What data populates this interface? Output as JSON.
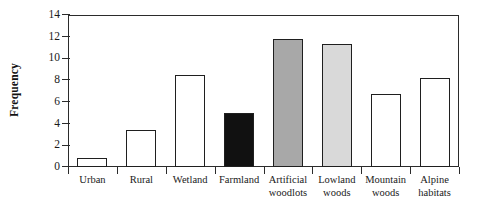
{
  "chart_data": {
    "type": "bar",
    "title": "",
    "xlabel": "",
    "ylabel": "Frequency",
    "ylim": [
      0,
      14
    ],
    "ytick_values": [
      0,
      2,
      4,
      6,
      8,
      10,
      12,
      14
    ],
    "ytick_labels": [
      "0",
      "2",
      "4",
      "6",
      "8",
      "10",
      "12",
      "14"
    ],
    "grid": false,
    "legend": "none",
    "categories": [
      "Urban",
      "Rural",
      "Wetland",
      "Farmland",
      "Artificial woodlots",
      "Lowland woods",
      "Mountain woods",
      "Alpine habitats"
    ],
    "category_lines": [
      [
        "Urban"
      ],
      [
        "Rural"
      ],
      [
        "Wetland"
      ],
      [
        "Farmland"
      ],
      [
        "Artificial",
        "woodlots"
      ],
      [
        "Lowland",
        "woods"
      ],
      [
        "Mountain",
        "woods"
      ],
      [
        "Alpine",
        "habitats"
      ]
    ],
    "values": [
      0.8,
      3.4,
      8.5,
      5.0,
      11.8,
      11.3,
      6.7,
      8.2
    ],
    "bar_fills": [
      "#ffffff",
      "#ffffff",
      "#ffffff",
      "#111111",
      "#a8a8a8",
      "#d9d9d9",
      "#ffffff",
      "#ffffff"
    ],
    "bar_edge_color": "#1f1f1f",
    "axis_color": "#2b2b2b",
    "background": "#ffffff"
  }
}
